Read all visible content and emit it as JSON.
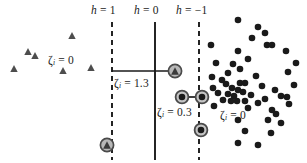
{
  "figure": {
    "name": "svm-soft-margin-diagram",
    "width": 307,
    "height": 163,
    "background": "#ffffff"
  },
  "colors": {
    "marker_fill": "#1a1a1a",
    "triangle_fill": "#4d4d4d",
    "line": "#1a1a1a",
    "support_ring": "#555555",
    "text": "#1a1a1a"
  },
  "boundaries": [
    {
      "id": "margin-positive",
      "label": "h = 1",
      "label_h": "h",
      "label_eq": "= 1",
      "x": 112,
      "style": "dashed",
      "y_top": 22,
      "y_bottom": 160
    },
    {
      "id": "decision",
      "label": "h = 0",
      "label_h": "h",
      "label_eq": "= 0",
      "x": 155,
      "style": "solid",
      "y_top": 22,
      "y_bottom": 160
    },
    {
      "id": "margin-negative",
      "label": "h = -1",
      "label_h": "h",
      "label_eq": "= −1",
      "x": 199,
      "style": "dashed",
      "y_top": 22,
      "y_bottom": 160
    }
  ],
  "boundary_labels": [
    {
      "text": "h = 1",
      "x": 91,
      "y": 4
    },
    {
      "text": "h = 0",
      "x": 134,
      "y": 4
    },
    {
      "text": "h = -1",
      "x": 176,
      "y": 4
    }
  ],
  "slack_labels": [
    {
      "id": "slack-left-zero",
      "symbol": "ζ",
      "sub": "i",
      "value": "= 0",
      "text": "ζi = 0",
      "x": 48,
      "y": 54
    },
    {
      "id": "slack-violation-1",
      "symbol": "ζ",
      "sub": "i",
      "value": "= 1.3",
      "text": "ζi = 1.3",
      "x": 114,
      "y": 77
    },
    {
      "id": "slack-violation-2",
      "symbol": "ζ",
      "sub": "i",
      "value": "= 0.3",
      "text": "ζi = 0.3",
      "x": 157,
      "y": 106
    },
    {
      "id": "slack-right-zero",
      "symbol": "ζ",
      "sub": "i",
      "value": "= 0",
      "text": "ζi = 0",
      "x": 220,
      "y": 109
    }
  ],
  "chart_data": {
    "type": "scatter",
    "title": "",
    "xlabel": "",
    "ylabel": "",
    "xlim": [
      0,
      307
    ],
    "ylim": [
      0,
      163
    ],
    "grid": false,
    "legend": null,
    "annotations": [
      {
        "text": "h = 1",
        "x": 91,
        "y": 4
      },
      {
        "text": "h = 0",
        "x": 134,
        "y": 4
      },
      {
        "text": "h = -1",
        "x": 176,
        "y": 4
      },
      {
        "text": "ζi = 0",
        "x": 48,
        "y": 54
      },
      {
        "text": "ζi = 1.3",
        "x": 114,
        "y": 77
      },
      {
        "text": "ζi = 0.3",
        "x": 157,
        "y": 106
      },
      {
        "text": "ζi = 0",
        "x": 220,
        "y": 109
      }
    ],
    "series": [
      {
        "name": "class-triangle",
        "marker": "triangle",
        "color": "#4d4d4d",
        "points": [
          {
            "x": 72,
            "y": 36
          },
          {
            "x": 28,
            "y": 52
          },
          {
            "x": 35,
            "y": 56
          },
          {
            "x": 14,
            "y": 69
          },
          {
            "x": 63,
            "y": 71
          },
          {
            "x": 91,
            "y": 68
          }
        ]
      },
      {
        "name": "class-triangle-support",
        "marker": "triangle-circled",
        "color": "#4d4d4d",
        "points": [
          {
            "x": 175,
            "y": 71,
            "slack": 1.3
          },
          {
            "x": 107,
            "y": 145,
            "slack": 0
          }
        ]
      },
      {
        "name": "class-circle-support",
        "marker": "circle-circled",
        "color": "#1a1a1a",
        "points": [
          {
            "x": 182,
            "y": 97,
            "slack": 0.3
          },
          {
            "x": 202,
            "y": 97,
            "slack": 0
          },
          {
            "x": 201,
            "y": 130,
            "slack": 0
          }
        ]
      },
      {
        "name": "class-circle",
        "marker": "circle",
        "color": "#1a1a1a",
        "points": [
          {
            "x": 238,
            "y": 20
          },
          {
            "x": 258,
            "y": 27
          },
          {
            "x": 265,
            "y": 33
          },
          {
            "x": 252,
            "y": 38
          },
          {
            "x": 211,
            "y": 45
          },
          {
            "x": 267,
            "y": 45
          },
          {
            "x": 272,
            "y": 45
          },
          {
            "x": 286,
            "y": 51
          },
          {
            "x": 238,
            "y": 51
          },
          {
            "x": 216,
            "y": 63
          },
          {
            "x": 296,
            "y": 63
          },
          {
            "x": 248,
            "y": 59
          },
          {
            "x": 233,
            "y": 64
          },
          {
            "x": 240,
            "y": 69
          },
          {
            "x": 228,
            "y": 73
          },
          {
            "x": 288,
            "y": 72
          },
          {
            "x": 212,
            "y": 77
          },
          {
            "x": 256,
            "y": 76
          },
          {
            "x": 222,
            "y": 80
          },
          {
            "x": 226,
            "y": 84
          },
          {
            "x": 240,
            "y": 83
          },
          {
            "x": 245,
            "y": 83
          },
          {
            "x": 213,
            "y": 88
          },
          {
            "x": 232,
            "y": 88
          },
          {
            "x": 238,
            "y": 90
          },
          {
            "x": 262,
            "y": 86
          },
          {
            "x": 275,
            "y": 90
          },
          {
            "x": 294,
            "y": 85
          },
          {
            "x": 218,
            "y": 93
          },
          {
            "x": 228,
            "y": 94
          },
          {
            "x": 234,
            "y": 96
          },
          {
            "x": 243,
            "y": 92
          },
          {
            "x": 251,
            "y": 95
          },
          {
            "x": 281,
            "y": 96
          },
          {
            "x": 287,
            "y": 97
          },
          {
            "x": 223,
            "y": 100
          },
          {
            "x": 231,
            "y": 101
          },
          {
            "x": 237,
            "y": 101
          },
          {
            "x": 245,
            "y": 101
          },
          {
            "x": 258,
            "y": 103
          },
          {
            "x": 265,
            "y": 99
          },
          {
            "x": 289,
            "y": 104
          },
          {
            "x": 214,
            "y": 106
          },
          {
            "x": 248,
            "y": 108
          },
          {
            "x": 272,
            "y": 110
          },
          {
            "x": 276,
            "y": 114
          },
          {
            "x": 238,
            "y": 120
          },
          {
            "x": 268,
            "y": 120
          },
          {
            "x": 281,
            "y": 123
          },
          {
            "x": 245,
            "y": 131
          },
          {
            "x": 271,
            "y": 133
          },
          {
            "x": 238,
            "y": 143
          },
          {
            "x": 258,
            "y": 145
          }
        ]
      }
    ],
    "connectors": [
      {
        "id": "slack-connector-1",
        "x1": 112,
        "y1": 71,
        "x2": 175,
        "y2": 71
      },
      {
        "id": "slack-connector-2",
        "x1": 182,
        "y1": 97,
        "x2": 202,
        "y2": 97
      }
    ]
  }
}
